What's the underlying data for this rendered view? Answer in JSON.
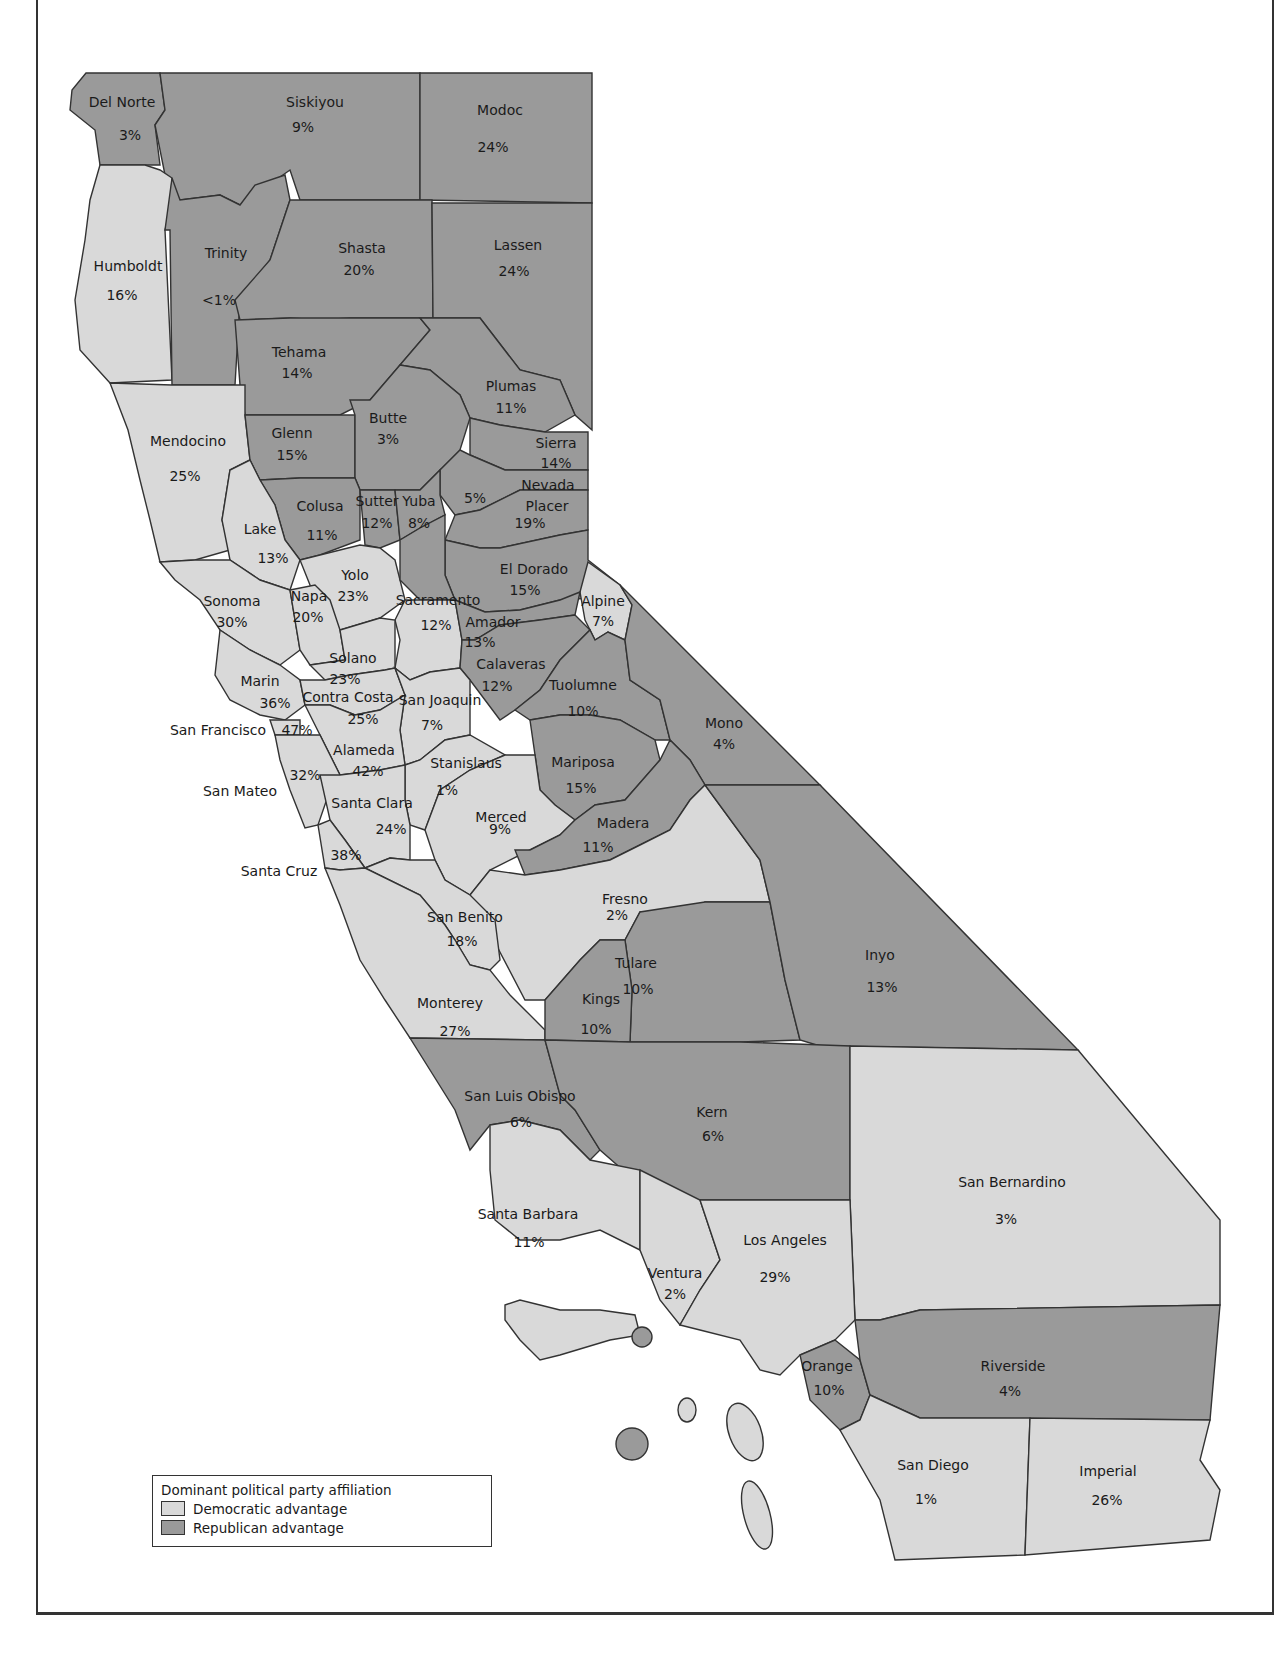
{
  "legend": {
    "title": "Dominant political party affiliation",
    "items": [
      {
        "label": "Democratic advantage",
        "color": "#d9d9d9"
      },
      {
        "label": "Republican advantage",
        "color": "#9a9a9a"
      }
    ]
  },
  "colors": {
    "democratic": "#d9d9d9",
    "republican": "#9a9a9a",
    "header_band": "#bdbdbd",
    "border": "#333333"
  },
  "counties": [
    {
      "name": "Del Norte",
      "value": "3%",
      "party": "R"
    },
    {
      "name": "Siskiyou",
      "value": "9%",
      "party": "R"
    },
    {
      "name": "Modoc",
      "value": "24%",
      "party": "R"
    },
    {
      "name": "Humboldt",
      "value": "16%",
      "party": "D"
    },
    {
      "name": "Trinity",
      "value": "<1%",
      "party": "R"
    },
    {
      "name": "Shasta",
      "value": "20%",
      "party": "R"
    },
    {
      "name": "Lassen",
      "value": "24%",
      "party": "R"
    },
    {
      "name": "Tehama",
      "value": "14%",
      "party": "R"
    },
    {
      "name": "Plumas",
      "value": "11%",
      "party": "R"
    },
    {
      "name": "Mendocino",
      "value": "25%",
      "party": "D"
    },
    {
      "name": "Glenn",
      "value": "15%",
      "party": "R"
    },
    {
      "name": "Butte",
      "value": "3%",
      "party": "R"
    },
    {
      "name": "Sierra",
      "value": "14%",
      "party": "R"
    },
    {
      "name": "Nevada",
      "value": "5%",
      "party": "R"
    },
    {
      "name": "Colusa",
      "value": "11%",
      "party": "R"
    },
    {
      "name": "Sutter",
      "value": "12%",
      "party": "R"
    },
    {
      "name": "Yuba",
      "value": "8%",
      "party": "R"
    },
    {
      "name": "Placer",
      "value": "19%",
      "party": "R"
    },
    {
      "name": "Lake",
      "value": "13%",
      "party": "D"
    },
    {
      "name": "Yolo",
      "value": "23%",
      "party": "D"
    },
    {
      "name": "El Dorado",
      "value": "15%",
      "party": "R"
    },
    {
      "name": "Sonoma",
      "value": "30%",
      "party": "D"
    },
    {
      "name": "Napa",
      "value": "20%",
      "party": "D"
    },
    {
      "name": "Sacramento",
      "value": "12%",
      "party": "D"
    },
    {
      "name": "Alpine",
      "value": "7%",
      "party": "D"
    },
    {
      "name": "Amador",
      "value": "13%",
      "party": "R"
    },
    {
      "name": "Solano",
      "value": "23%",
      "party": "D"
    },
    {
      "name": "Marin",
      "value": "36%",
      "party": "D"
    },
    {
      "name": "Calaveras",
      "value": "12%",
      "party": "R"
    },
    {
      "name": "Contra Costa",
      "value": "25%",
      "party": "D"
    },
    {
      "name": "San Joaquin",
      "value": "7%",
      "party": "D"
    },
    {
      "name": "Tuolumne",
      "value": "10%",
      "party": "R"
    },
    {
      "name": "San Francisco",
      "value": "47%",
      "party": "D"
    },
    {
      "name": "Mono",
      "value": "4%",
      "party": "R"
    },
    {
      "name": "Alameda",
      "value": "42%",
      "party": "D"
    },
    {
      "name": "Stanislaus",
      "value": "1%",
      "party": "D"
    },
    {
      "name": "Mariposa",
      "value": "15%",
      "party": "R"
    },
    {
      "name": "San Mateo",
      "value": "32%",
      "party": "D"
    },
    {
      "name": "Santa Clara",
      "value": "24%",
      "party": "D"
    },
    {
      "name": "Merced",
      "value": "9%",
      "party": "D"
    },
    {
      "name": "Madera",
      "value": "11%",
      "party": "R"
    },
    {
      "name": "Santa Cruz",
      "value": "38%",
      "party": "D"
    },
    {
      "name": "Fresno",
      "value": "2%",
      "party": "D"
    },
    {
      "name": "San Benito",
      "value": "18%",
      "party": "D"
    },
    {
      "name": "Tulare",
      "value": "10%",
      "party": "R"
    },
    {
      "name": "Inyo",
      "value": "13%",
      "party": "R"
    },
    {
      "name": "Monterey",
      "value": "27%",
      "party": "D"
    },
    {
      "name": "Kings",
      "value": "10%",
      "party": "R"
    },
    {
      "name": "San Luis Obispo",
      "value": "6%",
      "party": "R"
    },
    {
      "name": "Kern",
      "value": "6%",
      "party": "R"
    },
    {
      "name": "San Bernardino",
      "value": "3%",
      "party": "D"
    },
    {
      "name": "Santa Barbara",
      "value": "11%",
      "party": "D"
    },
    {
      "name": "Los Angeles",
      "value": "29%",
      "party": "D"
    },
    {
      "name": "Ventura",
      "value": "2%",
      "party": "D"
    },
    {
      "name": "Orange",
      "value": "10%",
      "party": "R"
    },
    {
      "name": "Riverside",
      "value": "4%",
      "party": "R"
    },
    {
      "name": "San Diego",
      "value": "1%",
      "party": "D"
    },
    {
      "name": "Imperial",
      "value": "26%",
      "party": "D"
    }
  ]
}
